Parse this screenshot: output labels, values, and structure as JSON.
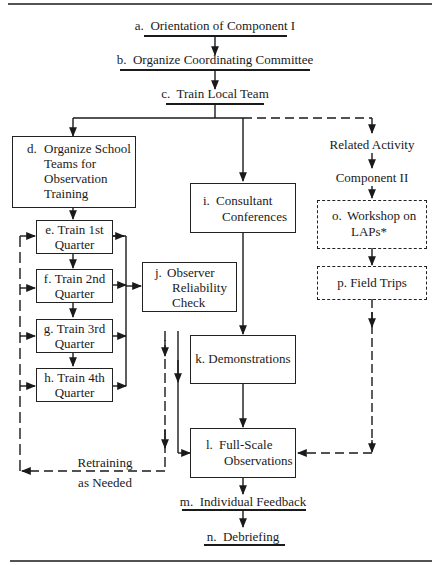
{
  "diagram": {
    "nodes": {
      "a": {
        "letter": "a.",
        "label": "Orientation of Component I"
      },
      "b": {
        "letter": "b.",
        "label": "Organize Coordinating Committee"
      },
      "c": {
        "letter": "c.",
        "label": "Train Local Team"
      },
      "d": {
        "letter": "d.",
        "lines": [
          "Organize School",
          "Teams for",
          "Observation",
          "Training"
        ]
      },
      "e": {
        "letter": "e.",
        "lines": [
          "Train 1st",
          "Quarter"
        ]
      },
      "f": {
        "letter": "f.",
        "lines": [
          "Train 2nd",
          "Quarter"
        ]
      },
      "g": {
        "letter": "g.",
        "lines": [
          "Train 3rd",
          "Quarter"
        ]
      },
      "h": {
        "letter": "h.",
        "lines": [
          "Train 4th",
          "Quarter"
        ]
      },
      "i": {
        "letter": "i.",
        "lines": [
          "Consultant",
          "Conferences"
        ]
      },
      "j": {
        "letter": "j.",
        "lines": [
          "Observer",
          "Reliability",
          "Check"
        ]
      },
      "k": {
        "letter": "k.",
        "label": "Demonstrations"
      },
      "l": {
        "letter": "l.",
        "lines": [
          "Full-Scale",
          "Observations"
        ]
      },
      "m": {
        "letter": "m.",
        "label": "Individual Feedback"
      },
      "n": {
        "letter": "n.",
        "label": "Debriefing"
      },
      "o": {
        "letter": "o.",
        "lines": [
          "Workshop on",
          "LAPs*"
        ]
      },
      "p": {
        "letter": "p.",
        "label": "Field Trips"
      }
    },
    "annotations": {
      "related_activity": "Related Activity",
      "component_ii": "Component II",
      "retraining": [
        "Retraining",
        "as Needed"
      ]
    },
    "edges": [
      {
        "from": "a",
        "to": "b",
        "style": "solid"
      },
      {
        "from": "b",
        "to": "c",
        "style": "solid"
      },
      {
        "from": "c",
        "to": "d",
        "style": "solid"
      },
      {
        "from": "c",
        "to": "i",
        "style": "solid"
      },
      {
        "from": "c",
        "to": "related_activity",
        "style": "dashed"
      },
      {
        "from": "related_activity",
        "to": "component_ii",
        "style": "solid"
      },
      {
        "from": "component_ii",
        "to": "o",
        "style": "solid"
      },
      {
        "from": "o",
        "to": "p",
        "style": "solid"
      },
      {
        "from": "p",
        "to": "l",
        "style": "dashed"
      },
      {
        "from": "d",
        "to": "e",
        "style": "solid"
      },
      {
        "from": "e",
        "to": "f",
        "style": "solid"
      },
      {
        "from": "f",
        "to": "g",
        "style": "solid"
      },
      {
        "from": "g",
        "to": "h",
        "style": "solid"
      },
      {
        "from": "e",
        "to": "j",
        "style": "solid"
      },
      {
        "from": "f",
        "to": "j",
        "style": "solid"
      },
      {
        "from": "g",
        "to": "j",
        "style": "solid"
      },
      {
        "from": "h",
        "to": "j",
        "style": "solid"
      },
      {
        "from": "i",
        "to": "k",
        "style": "solid"
      },
      {
        "from": "k",
        "to": "l",
        "style": "solid"
      },
      {
        "from": "j",
        "to": "l",
        "style": "solid"
      },
      {
        "from": "j",
        "to": "e,f,g,h",
        "style": "dashed",
        "label": "Retraining as Needed"
      },
      {
        "from": "l",
        "to": "m",
        "style": "solid"
      },
      {
        "from": "m",
        "to": "n",
        "style": "solid"
      }
    ]
  }
}
